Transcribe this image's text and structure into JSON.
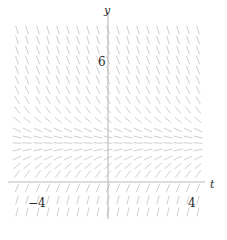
{
  "figure": {
    "kind": "slope-field",
    "background": "#ffffff"
  },
  "axes": {
    "x_axis_label": "t",
    "y_axis_label": "y",
    "x_axis_color": "#b9b9b9",
    "y_axis_color": "#b9b9b9",
    "origin_px": {
      "x": 108,
      "y": 182
    },
    "x_tick_labels": [
      {
        "text": "−4",
        "value": -4,
        "px_x": 28,
        "px_y": 196
      },
      {
        "text": "4",
        "value": 4,
        "px_x": 188,
        "px_y": 196
      }
    ],
    "y_tick_labels": [
      {
        "text": "6",
        "value": 6,
        "px_x": 98,
        "px_y": 55
      }
    ],
    "x_label_px": {
      "x": 210,
      "y": 178
    },
    "y_label_px": {
      "x": 104,
      "y": 4
    }
  },
  "chart_data": {
    "type": "scatter",
    "title": "",
    "xlabel": "t",
    "ylabel": "y",
    "xlim": [
      -4.6,
      4.6
    ],
    "ylim": [
      -1.2,
      9.4
    ],
    "grid": false,
    "legend": null,
    "stroke_color": "#cfcfcf",
    "stroke_width": 1.0,
    "segment_length_px": 9,
    "columns": 19,
    "rows": 20,
    "field_box_px": {
      "left": 17,
      "top": 25,
      "right": 201,
      "bottom": 217
    },
    "equilibrium_y": 3.8,
    "note": "Slopes are steeply negative far above the equilibrium, flatten to zero at the equilibrium line, turn positive just below it, and steepen to nearly vertical positive below the t-axis. Slope depends only on y (autonomous).",
    "slope_by_row": [
      {
        "row": 0,
        "py": 30,
        "y": 8.9,
        "slope_deg": -72
      },
      {
        "row": 1,
        "py": 40,
        "y": 8.3,
        "slope_deg": -72
      },
      {
        "row": 2,
        "py": 50,
        "y": 7.8,
        "slope_deg": -71
      },
      {
        "row": 3,
        "py": 60,
        "y": 7.2,
        "slope_deg": -70
      },
      {
        "row": 4,
        "py": 70,
        "y": 6.7,
        "slope_deg": -69
      },
      {
        "row": 5,
        "py": 80,
        "y": 6.1,
        "slope_deg": -67
      },
      {
        "row": 6,
        "py": 90,
        "y": 5.6,
        "slope_deg": -64
      },
      {
        "row": 7,
        "py": 100,
        "y": 5.0,
        "slope_deg": -60
      },
      {
        "row": 8,
        "py": 110,
        "y": 4.5,
        "slope_deg": -52
      },
      {
        "row": 9,
        "py": 120,
        "y": 3.9,
        "slope_deg": -40
      },
      {
        "row": 10,
        "py": 130,
        "y": 3.4,
        "slope_deg": -26
      },
      {
        "row": 11,
        "py": 137,
        "y": 3.0,
        "slope_deg": -12
      },
      {
        "row": 12,
        "py": 143,
        "y": 2.6,
        "slope_deg": -3
      },
      {
        "row": 13,
        "py": 150,
        "y": 2.2,
        "slope_deg": 12
      },
      {
        "row": 14,
        "py": 158,
        "y": 1.7,
        "slope_deg": 26
      },
      {
        "row": 15,
        "py": 166,
        "y": 1.2,
        "slope_deg": 40
      },
      {
        "row": 16,
        "py": 174,
        "y": 0.7,
        "slope_deg": 52
      },
      {
        "row": 17,
        "py": 188,
        "y": -0.1,
        "slope_deg": 68
      },
      {
        "row": 18,
        "py": 200,
        "y": -0.8,
        "slope_deg": 73
      },
      {
        "row": 19,
        "py": 212,
        "y": -1.5,
        "slope_deg": 76
      }
    ],
    "column_px": [
      17,
      27,
      38,
      48,
      58,
      68,
      78,
      88,
      98,
      108,
      118,
      128,
      138,
      148,
      158,
      168,
      178,
      188,
      198
    ]
  }
}
